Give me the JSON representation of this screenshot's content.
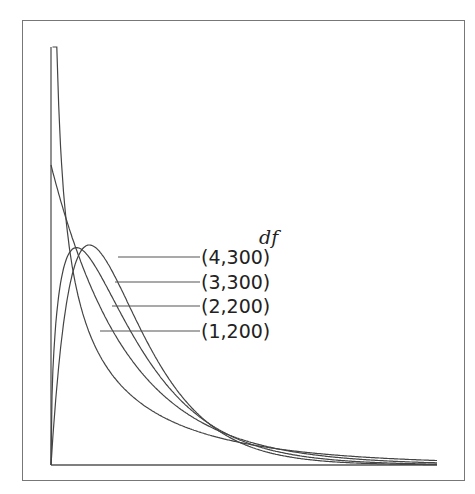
{
  "chart_data": {
    "type": "line",
    "title": "",
    "xlabel": "",
    "ylabel": "",
    "legend_title": "df",
    "legend_position": "inline-right",
    "grid": false,
    "xlim": [
      0,
      5
    ],
    "ylim": [
      0,
      1.0
    ],
    "series": [
      {
        "name": "(4,300)",
        "df1": 4,
        "df2": 300
      },
      {
        "name": "(3,300)",
        "df1": 3,
        "df2": 300
      },
      {
        "name": "(2,200)",
        "df1": 2,
        "df2": 200
      },
      {
        "name": "(1,200)",
        "df1": 1,
        "df2": 200
      }
    ],
    "annotations": [
      {
        "text": "(4,300)",
        "y_px": 257,
        "leader_start_x_px": 118
      },
      {
        "text": "(3,300)",
        "y_px": 282,
        "leader_start_x_px": 115
      },
      {
        "text": "(2,200)",
        "y_px": 306,
        "leader_start_x_px": 112
      },
      {
        "text": "(1,200)",
        "y_px": 331,
        "leader_start_x_px": 100
      }
    ]
  },
  "legend": {
    "title": "df",
    "items": [
      "(4,300)",
      "(3,300)",
      "(2,200)",
      "(1,200)"
    ]
  },
  "colors": {
    "line": "#444444",
    "frame": "#777777",
    "background": "#ffffff"
  }
}
